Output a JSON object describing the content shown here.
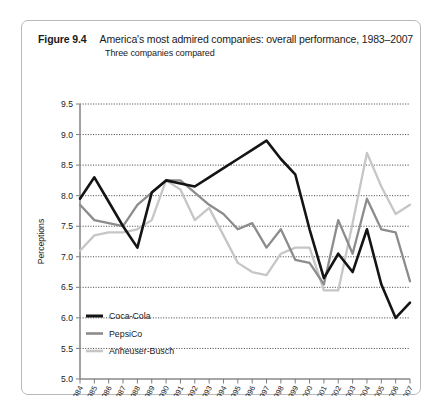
{
  "figure": {
    "number": "Figure 9.4",
    "title": "America's most admired companies: overall performance, 1983–2007",
    "subtitle": "Three companies compared"
  },
  "chart_data": {
    "type": "line",
    "title": "America's most admired companies: overall performance, 1983–2007",
    "subtitle": "Three companies compared",
    "xlabel": "",
    "ylabel": "Perceptions",
    "ylim": [
      5.0,
      9.5
    ],
    "ytick_step": 0.5,
    "yticks": [
      "5.0",
      "5.5",
      "6.0",
      "6.5",
      "7.0",
      "7.5",
      "8.0",
      "8.5",
      "9.0",
      "9.5"
    ],
    "grid": true,
    "grid_axis": "y",
    "legend_position": "bottom-left",
    "categories": [
      "1984",
      "1985",
      "1986",
      "1987",
      "1988",
      "1989",
      "1990",
      "1991",
      "1992",
      "1993",
      "1994",
      "1995",
      "1996",
      "1997",
      "1998",
      "1999",
      "2000",
      "2001",
      "2002",
      "2003",
      "2004",
      "2005",
      "2006",
      "2007"
    ],
    "series": [
      {
        "name": "Coca-Cola",
        "color": "#141414",
        "width": 2.6,
        "values": [
          7.95,
          8.3,
          7.9,
          7.5,
          7.15,
          8.05,
          8.25,
          8.2,
          8.15,
          8.3,
          8.45,
          8.6,
          8.75,
          8.9,
          8.6,
          8.35,
          7.45,
          6.65,
          7.05,
          6.75,
          7.45,
          6.55,
          6.0,
          6.25
        ]
      },
      {
        "name": "PepsiCo",
        "color": "#8c8c8c",
        "width": 2.3,
        "values": [
          7.85,
          7.6,
          7.55,
          7.5,
          7.85,
          8.05,
          8.25,
          8.25,
          8.05,
          7.85,
          7.7,
          7.45,
          7.55,
          7.15,
          7.45,
          6.95,
          6.9,
          6.55,
          7.6,
          7.05,
          7.95,
          7.45,
          7.4,
          6.6
        ]
      },
      {
        "name": "Anheuser-Busch",
        "color": "#c6c6c6",
        "width": 2.3,
        "values": [
          7.1,
          7.35,
          7.4,
          7.4,
          7.45,
          7.6,
          8.25,
          8.1,
          7.6,
          7.8,
          7.35,
          6.9,
          6.75,
          6.7,
          7.05,
          7.15,
          7.15,
          6.45,
          6.45,
          7.55,
          8.7,
          8.15,
          7.7,
          7.85
        ]
      }
    ]
  },
  "legend": {
    "items": [
      {
        "label": "Coca-Cola",
        "color": "#141414"
      },
      {
        "label": "PepsiCo",
        "color": "#8c8c8c"
      },
      {
        "label": "Anheuser-Busch",
        "color": "#c6c6c6"
      }
    ]
  }
}
